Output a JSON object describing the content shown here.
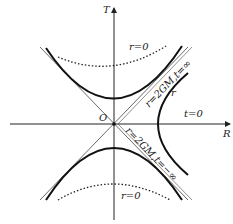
{
  "diagram": {
    "type": "Kruskal-Szekeres diagram",
    "axes": {
      "vertical_label": "T",
      "horizontal_label": "R",
      "origin_label": "O"
    },
    "labels": {
      "r_zero_top": "r=0",
      "r_zero_bottom": "r=0",
      "horizon_future": "r=2GM,t=∞",
      "horizon_past": "r=2GM,t=−∞",
      "r_curve": "r",
      "t_zero": "t=0"
    },
    "colors": {
      "line": "#222222",
      "background": "#ffffff"
    }
  }
}
